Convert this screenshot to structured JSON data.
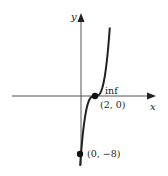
{
  "chart_data": {
    "type": "line",
    "title": "",
    "xlabel": "x",
    "ylabel": "y",
    "function": "y = (x - 2)^3",
    "series": [
      {
        "name": "curve",
        "x": [
          -0.2,
          0,
          0.5,
          1,
          1.5,
          2,
          2.5,
          3,
          3.5,
          4,
          4.1
        ],
        "values": [
          -10.65,
          -8,
          -3.375,
          -1,
          -0.125,
          0,
          0.125,
          1,
          3.375,
          8,
          9.26
        ]
      }
    ],
    "annotations": [
      {
        "label": "inf",
        "point": [
          2,
          0
        ]
      },
      {
        "label": "(2, 0)",
        "point": [
          2,
          0
        ]
      },
      {
        "label": "(0, −8)",
        "point": [
          0,
          -8
        ]
      }
    ],
    "grid": false,
    "legend": "none"
  },
  "axes": {
    "x_label": "x",
    "y_label": "y"
  },
  "points": [
    {
      "label": "(2, 0)",
      "note": "inf"
    },
    {
      "label": "(0, −8)"
    }
  ],
  "colors": {
    "axis": "#555555",
    "curve": "#222222",
    "point": "#111111"
  }
}
